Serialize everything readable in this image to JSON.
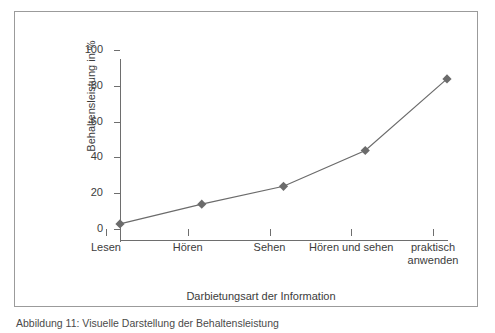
{
  "figure": {
    "caption": "Abbildung 11: Visuelle Darstellung der Behaltensleistung"
  },
  "chart_data": {
    "type": "line",
    "title": "",
    "xlabel": "Darbietungsart der Information",
    "ylabel": "Behaltensleistung in %",
    "categories": [
      "Lesen",
      "Hören",
      "Sehen",
      "Hören und sehen",
      "praktisch anwenden"
    ],
    "values": [
      9,
      20,
      30,
      50,
      90
    ],
    "ylim": [
      0,
      100
    ],
    "yticks": [
      0,
      20,
      40,
      60,
      80,
      100
    ],
    "ytick_labels": [
      "0",
      "20",
      "40",
      "60",
      "80",
      "100"
    ],
    "grid": false,
    "legend": null,
    "marker": "diamond",
    "series_color": "#6b6b6b",
    "axis_color": "#6e6e6e",
    "text_color": "#3c3c3c",
    "frame_color": "#9b9b9b",
    "background": "#ffffff"
  }
}
